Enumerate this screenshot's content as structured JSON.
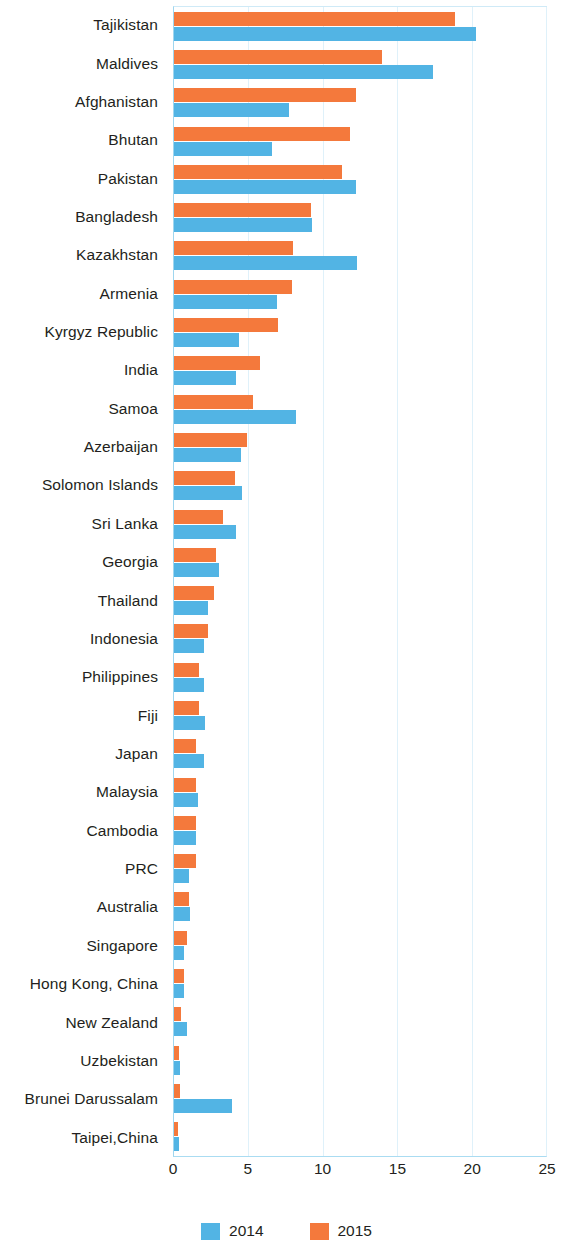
{
  "chart_data": {
    "type": "bar",
    "orientation": "horizontal",
    "title": "",
    "subtitle": "",
    "xlabel": "",
    "ylabel": "",
    "xlim": [
      0,
      25
    ],
    "xticks": [
      "0",
      "5",
      "10",
      "15",
      "20",
      "25"
    ],
    "grid": true,
    "legend_position": "bottom-center",
    "categories": [
      "Tajikistan",
      "Maldives",
      "Afghanistan",
      "Bhutan",
      "Pakistan",
      "Bangladesh",
      "Kazakhstan",
      "Armenia",
      "Kyrgyz Republic",
      "India",
      "Samoa",
      "Azerbaijan",
      "Solomon Islands",
      "Sri Lanka",
      "Georgia",
      "Thailand",
      "Indonesia",
      "Philippines",
      "Fiji",
      "Japan",
      "Malaysia",
      "Cambodia",
      "PRC",
      "Australia",
      "Singapore",
      "Hong Kong, China",
      "New Zealand",
      "Uzbekistan",
      "Brunei Darussalam",
      "Taipei,China"
    ],
    "series": [
      {
        "name": "2015",
        "color": "#f4793c",
        "values": [
          18.9,
          14.0,
          12.2,
          11.8,
          11.3,
          9.2,
          8.0,
          7.9,
          7.0,
          5.8,
          5.3,
          4.9,
          4.1,
          3.3,
          2.8,
          2.7,
          2.3,
          1.7,
          1.7,
          1.5,
          1.5,
          1.5,
          1.5,
          1.0,
          0.9,
          0.7,
          0.5,
          0.35,
          0.4,
          0.3
        ]
      },
      {
        "name": "2014",
        "color": "#52b4e4",
        "values": [
          20.3,
          17.4,
          7.7,
          6.6,
          12.2,
          9.3,
          12.3,
          6.9,
          4.4,
          4.2,
          8.2,
          4.5,
          4.6,
          4.2,
          3.0,
          2.3,
          2.0,
          2.0,
          2.1,
          2.0,
          1.6,
          1.5,
          1.0,
          1.1,
          0.7,
          0.65,
          0.85,
          0.4,
          3.9,
          0.35
        ]
      }
    ],
    "legend": [
      {
        "label": "2014",
        "color": "#52b4e4"
      },
      {
        "label": "2015",
        "color": "#f4793c"
      }
    ]
  }
}
